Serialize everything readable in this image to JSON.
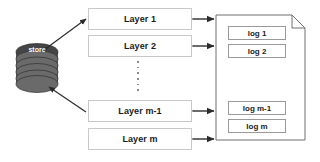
{
  "diagram": {
    "colors": {
      "background": "#ffffff",
      "layer_border": "#c9c9c9",
      "log_border": "#9a9a9a",
      "document_border": "#6f6f6f",
      "arrow": "#2b2b2b",
      "store_fill": "#4a4a4a",
      "store_text": "#ffffff",
      "dots": "#8a8a8a"
    },
    "store": {
      "label": "store",
      "icon": "database-cylinder-icon"
    },
    "layers": [
      {
        "label": "Layer 1"
      },
      {
        "label": "Layer 2"
      },
      {
        "label": "Layer m-1"
      },
      {
        "label": "Layer m"
      }
    ],
    "layers_ellipsis": "vertical-dots",
    "logs": [
      {
        "label": "log 1"
      },
      {
        "label": "log 2"
      },
      {
        "label": "log m-1"
      },
      {
        "label": "log m"
      }
    ],
    "document": {
      "name": "log-document",
      "corner": "folded-top-right"
    },
    "connections": [
      {
        "name": "store-to-layer-1",
        "style": "double-headed-diagonal"
      },
      {
        "name": "store-to-layer-m-1",
        "style": "single-headed-diagonal"
      },
      {
        "name": "layer-1-to-document",
        "style": "double-headed-horizontal"
      },
      {
        "name": "layer-2-to-document",
        "style": "double-headed-horizontal"
      },
      {
        "name": "layer-m-1-to-document",
        "style": "double-headed-horizontal"
      },
      {
        "name": "layer-m-to-document",
        "style": "double-headed-horizontal"
      }
    ]
  }
}
